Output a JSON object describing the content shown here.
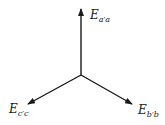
{
  "diagram": {
    "type": "phasor-diagram",
    "stroke_color": "#1a1a1a",
    "background": "#ffffff",
    "origin": {
      "x": 81,
      "y": 75
    },
    "phasors": [
      {
        "id": "a",
        "main": "E",
        "subscript": "a′a",
        "tip": {
          "x": 81,
          "y": 9
        },
        "label_pos": {
          "x": 90,
          "y": 9
        }
      },
      {
        "id": "c",
        "main": "E",
        "subscript": "c′c",
        "tip": {
          "x": 28,
          "y": 104
        },
        "label_pos": {
          "x": 9,
          "y": 103
        }
      },
      {
        "id": "b",
        "main": "E",
        "subscript": "b′b",
        "tip": {
          "x": 132,
          "y": 104
        },
        "label_pos": {
          "x": 138,
          "y": 104
        }
      }
    ]
  }
}
